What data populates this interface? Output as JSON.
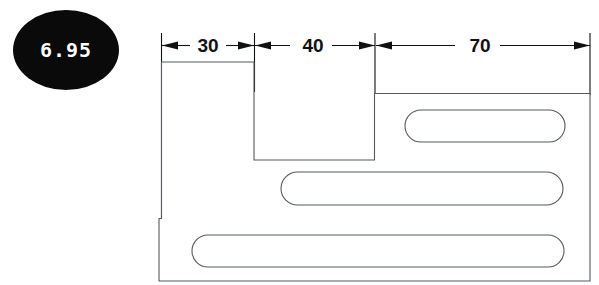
{
  "drawing": {
    "title": "Stepped plate with three slots",
    "badge": {
      "label": "6.95",
      "shape": "ellipse",
      "fill_color": "#0a0a0a",
      "text_color": "#ffffff"
    },
    "dimensions": [
      {
        "label": "30",
        "from_x": 161,
        "to_x": 254,
        "value": 30,
        "units": ""
      },
      {
        "label": "40",
        "from_x": 254,
        "to_x": 375,
        "value": 40,
        "units": ""
      },
      {
        "label": "70",
        "from_x": 375,
        "to_x": 590,
        "value": 70,
        "units": ""
      }
    ],
    "geometry": {
      "outline_color": "#555a60",
      "fill_color": "#ffffff",
      "dimension_line_color": "#111111"
    },
    "slots": [
      {
        "name": "top-slot",
        "x": 405,
        "y": 110,
        "width": 160,
        "height": 32
      },
      {
        "name": "middle-slot",
        "x": 281,
        "y": 172,
        "width": 282,
        "height": 33
      },
      {
        "name": "bottom-slot",
        "x": 192,
        "y": 235,
        "width": 372,
        "height": 32
      }
    ]
  }
}
